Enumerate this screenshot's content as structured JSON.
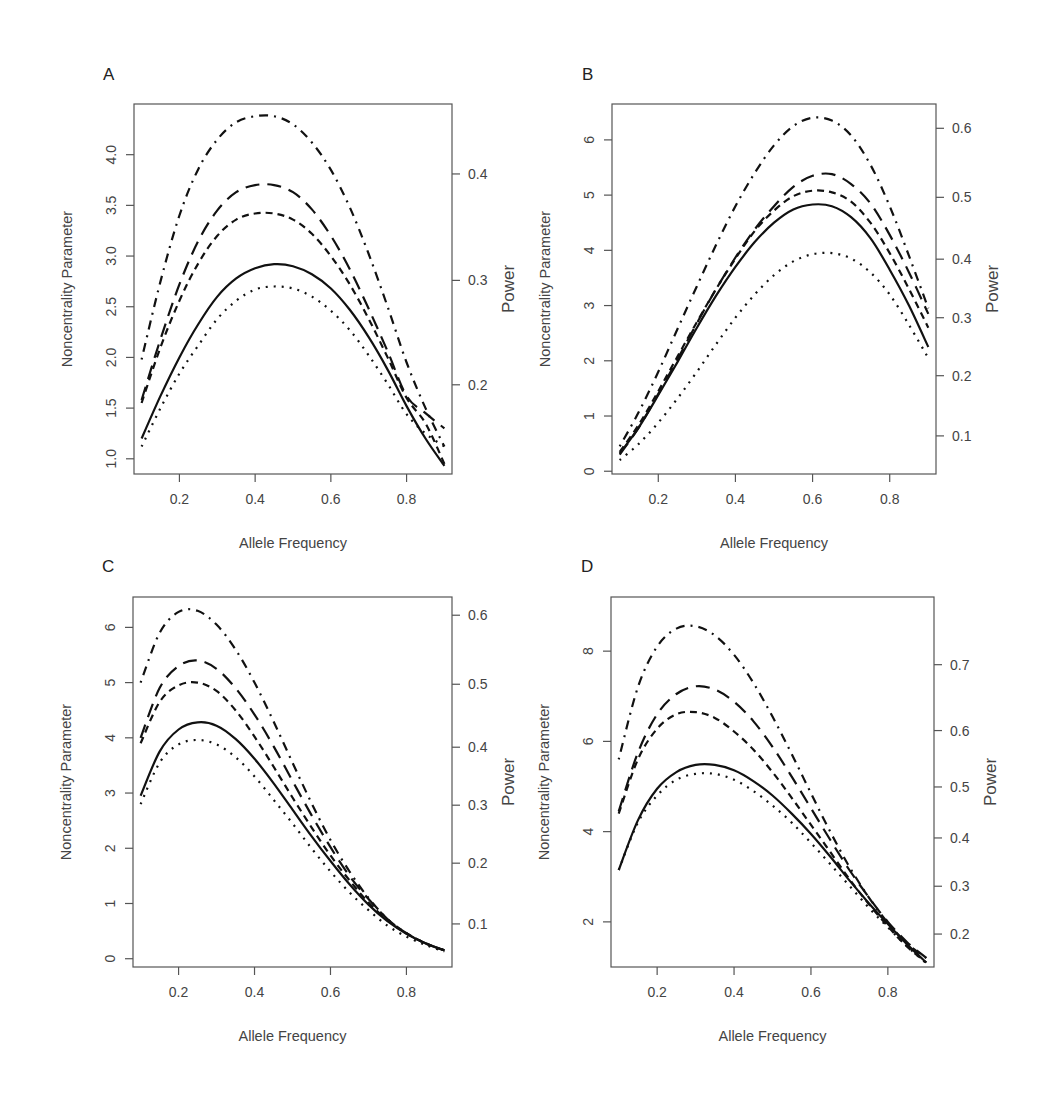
{
  "figure": {
    "background": "#ffffff",
    "line_color": "#111111"
  },
  "line_styles": {
    "solid": "",
    "dotted": "2 6",
    "dashed": "7 5",
    "longdash": "14 8",
    "dotdash": "2 6 9 6"
  },
  "chart_data": [
    {
      "panel": "A",
      "type": "line",
      "xlabel": "Allele Frequency",
      "ylabel": "Noncentrality Parameter",
      "ylabel_right": "Power",
      "xlim": [
        0.08,
        0.92
      ],
      "ylim": [
        0.85,
        4.5
      ],
      "x_ticks": [
        0.2,
        0.4,
        0.6,
        0.8
      ],
      "x_tick_labels": [
        "0.2",
        "0.4",
        "0.6",
        "0.8"
      ],
      "y_ticks": [
        1.0,
        1.5,
        2.0,
        2.5,
        3.0,
        3.5,
        4.0
      ],
      "y_tick_labels": [
        "1.0",
        "1.5",
        "2.0",
        "2.5",
        "3.0",
        "3.5",
        "4.0"
      ],
      "power_ticks": [
        {
          "label": "0.2",
          "ncp": 1.73
        },
        {
          "label": "0.3",
          "ncp": 2.76
        },
        {
          "label": "0.4",
          "ncp": 3.81
        }
      ],
      "grid": false,
      "legend": null,
      "box": {
        "left": 134,
        "top": 104,
        "right": 452,
        "bottom": 474
      },
      "label_pos": [
        103,
        80
      ],
      "x": [
        0.1,
        0.15,
        0.2,
        0.25,
        0.3,
        0.35,
        0.4,
        0.45,
        0.5,
        0.55,
        0.6,
        0.65,
        0.7,
        0.75,
        0.8,
        0.85,
        0.9
      ],
      "series": [
        {
          "name": "solid",
          "style": "solid",
          "values": [
            1.2,
            1.62,
            2.0,
            2.33,
            2.6,
            2.78,
            2.88,
            2.92,
            2.9,
            2.82,
            2.68,
            2.47,
            2.2,
            1.88,
            1.52,
            1.2,
            0.93
          ]
        },
        {
          "name": "dotted",
          "style": "dotted",
          "values": [
            1.12,
            1.5,
            1.84,
            2.12,
            2.38,
            2.56,
            2.67,
            2.7,
            2.68,
            2.6,
            2.46,
            2.27,
            2.02,
            1.74,
            1.44,
            1.25,
            1.12
          ]
        },
        {
          "name": "dashed",
          "style": "dashed",
          "values": [
            1.55,
            2.1,
            2.56,
            2.93,
            3.2,
            3.36,
            3.42,
            3.42,
            3.36,
            3.22,
            3.0,
            2.72,
            2.38,
            2.0,
            1.6,
            1.35,
            0.95
          ]
        },
        {
          "name": "longdash",
          "style": "longdash",
          "values": [
            1.58,
            2.18,
            2.72,
            3.15,
            3.45,
            3.63,
            3.7,
            3.7,
            3.63,
            3.46,
            3.2,
            2.87,
            2.48,
            2.06,
            1.62,
            1.45,
            1.3
          ]
        },
        {
          "name": "dotdash",
          "style": "dotdash",
          "values": [
            1.98,
            2.75,
            3.4,
            3.86,
            4.15,
            4.32,
            4.38,
            4.38,
            4.3,
            4.12,
            3.85,
            3.48,
            3.02,
            2.5,
            1.95,
            1.5,
            1.12
          ]
        }
      ]
    },
    {
      "panel": "B",
      "type": "line",
      "xlabel": "Allele Frequency",
      "ylabel": "Noncentrality Parameter",
      "ylabel_right": "Power",
      "xlim": [
        0.08,
        0.92
      ],
      "ylim": [
        -0.05,
        6.65
      ],
      "x_ticks": [
        0.2,
        0.4,
        0.6,
        0.8
      ],
      "x_tick_labels": [
        "0.2",
        "0.4",
        "0.6",
        "0.8"
      ],
      "y_ticks": [
        0,
        1,
        2,
        3,
        4,
        5,
        6
      ],
      "y_tick_labels": [
        "0",
        "1",
        "2",
        "3",
        "4",
        "5",
        "6"
      ],
      "power_ticks": [
        {
          "label": "0.1",
          "ncp": 0.64
        },
        {
          "label": "0.2",
          "ncp": 1.73
        },
        {
          "label": "0.3",
          "ncp": 2.78
        },
        {
          "label": "0.4",
          "ncp": 3.84
        },
        {
          "label": "0.5",
          "ncp": 4.96
        },
        {
          "label": "0.6",
          "ncp": 6.21
        }
      ],
      "grid": false,
      "legend": null,
      "box": {
        "left": 612,
        "top": 104,
        "right": 936,
        "bottom": 474
      },
      "label_pos": [
        582,
        80
      ],
      "x": [
        0.1,
        0.15,
        0.2,
        0.25,
        0.3,
        0.35,
        0.4,
        0.45,
        0.5,
        0.55,
        0.6,
        0.65,
        0.7,
        0.75,
        0.8,
        0.85,
        0.9
      ],
      "series": [
        {
          "name": "solid",
          "style": "solid",
          "values": [
            0.32,
            0.8,
            1.38,
            1.98,
            2.6,
            3.18,
            3.7,
            4.15,
            4.5,
            4.74,
            4.83,
            4.8,
            4.6,
            4.22,
            3.65,
            3.0,
            2.25
          ]
        },
        {
          "name": "dotted",
          "style": "dotted",
          "values": [
            0.2,
            0.5,
            0.88,
            1.32,
            1.8,
            2.3,
            2.78,
            3.2,
            3.55,
            3.8,
            3.93,
            3.95,
            3.85,
            3.6,
            3.2,
            2.65,
            2.05
          ]
        },
        {
          "name": "dashed",
          "style": "dashed",
          "values": [
            0.35,
            0.85,
            1.45,
            2.08,
            2.7,
            3.3,
            3.85,
            4.35,
            4.72,
            4.98,
            5.08,
            5.05,
            4.88,
            4.5,
            3.95,
            3.3,
            2.6
          ]
        },
        {
          "name": "longdash",
          "style": "longdash",
          "values": [
            0.3,
            0.8,
            1.4,
            2.03,
            2.68,
            3.3,
            3.87,
            4.38,
            4.8,
            5.15,
            5.35,
            5.38,
            5.2,
            4.85,
            4.28,
            3.6,
            2.85
          ]
        },
        {
          "name": "dotdash",
          "style": "dotdash",
          "values": [
            0.45,
            1.08,
            1.8,
            2.58,
            3.35,
            4.1,
            4.8,
            5.4,
            5.9,
            6.25,
            6.4,
            6.35,
            6.08,
            5.55,
            4.8,
            3.9,
            2.95
          ]
        }
      ]
    },
    {
      "panel": "C",
      "type": "line",
      "xlabel": "Allele Frequency",
      "ylabel": "Noncentrality Parameter",
      "ylabel_right": "Power",
      "xlim": [
        0.08,
        0.92
      ],
      "ylim": [
        -0.15,
        6.55
      ],
      "x_ticks": [
        0.2,
        0.4,
        0.6,
        0.8
      ],
      "x_tick_labels": [
        "0.2",
        "0.4",
        "0.6",
        "0.8"
      ],
      "y_ticks": [
        0,
        1,
        2,
        3,
        4,
        5,
        6
      ],
      "y_tick_labels": [
        "0",
        "1",
        "2",
        "3",
        "4",
        "5",
        "6"
      ],
      "power_ticks": [
        {
          "label": "0.1",
          "ncp": 0.63
        },
        {
          "label": "0.2",
          "ncp": 1.73
        },
        {
          "label": "0.3",
          "ncp": 2.78
        },
        {
          "label": "0.4",
          "ncp": 3.83
        },
        {
          "label": "0.5",
          "ncp": 4.97
        },
        {
          "label": "0.6",
          "ncp": 6.22
        }
      ],
      "grid": false,
      "legend": null,
      "box": {
        "left": 133,
        "top": 597,
        "right": 452,
        "bottom": 967
      },
      "label_pos": [
        102,
        572
      ],
      "x": [
        0.1,
        0.15,
        0.2,
        0.25,
        0.3,
        0.35,
        0.4,
        0.45,
        0.5,
        0.55,
        0.6,
        0.65,
        0.7,
        0.75,
        0.8,
        0.85,
        0.9
      ],
      "series": [
        {
          "name": "solid",
          "style": "solid",
          "values": [
            2.95,
            3.75,
            4.15,
            4.28,
            4.22,
            3.98,
            3.62,
            3.18,
            2.7,
            2.22,
            1.77,
            1.35,
            0.98,
            0.68,
            0.45,
            0.28,
            0.15
          ]
        },
        {
          "name": "dotted",
          "style": "dotted",
          "values": [
            2.8,
            3.55,
            3.88,
            3.96,
            3.88,
            3.65,
            3.3,
            2.88,
            2.45,
            2.0,
            1.58,
            1.2,
            0.88,
            0.6,
            0.4,
            0.25,
            0.13
          ]
        },
        {
          "name": "dashed",
          "style": "dashed",
          "values": [
            3.9,
            4.65,
            4.95,
            5.0,
            4.85,
            4.5,
            4.02,
            3.48,
            2.92,
            2.38,
            1.87,
            1.42,
            1.02,
            0.7,
            0.46,
            0.28,
            0.15
          ]
        },
        {
          "name": "longdash",
          "style": "longdash",
          "values": [
            4.0,
            4.9,
            5.3,
            5.4,
            5.25,
            4.9,
            4.42,
            3.85,
            3.22,
            2.6,
            2.02,
            1.5,
            1.08,
            0.72,
            0.46,
            0.28,
            0.15
          ]
        },
        {
          "name": "dotdash",
          "style": "dotdash",
          "values": [
            5.0,
            5.9,
            6.28,
            6.3,
            6.05,
            5.6,
            5.0,
            4.3,
            3.55,
            2.82,
            2.15,
            1.58,
            1.1,
            0.72,
            0.46,
            0.28,
            0.15
          ]
        }
      ]
    },
    {
      "panel": "D",
      "type": "line",
      "xlabel": "Allele Frequency",
      "ylabel": "Noncentrality Parameter",
      "ylabel_right": "Power",
      "xlim": [
        0.08,
        0.92
      ],
      "ylim": [
        1.0,
        9.2
      ],
      "x_ticks": [
        0.2,
        0.4,
        0.6,
        0.8
      ],
      "x_tick_labels": [
        "0.2",
        "0.4",
        "0.6",
        "0.8"
      ],
      "y_ticks": [
        2,
        4,
        6,
        8
      ],
      "y_tick_labels": [
        "2",
        "4",
        "6",
        "8"
      ],
      "power_ticks": [
        {
          "label": "0.2",
          "ncp": 1.73
        },
        {
          "label": "0.3",
          "ncp": 2.79
        },
        {
          "label": "0.4",
          "ncp": 3.86
        },
        {
          "label": "0.5",
          "ncp": 4.99
        },
        {
          "label": "0.6",
          "ncp": 6.24
        },
        {
          "label": "0.7",
          "ncp": 7.7
        }
      ],
      "grid": false,
      "legend": null,
      "box": {
        "left": 611,
        "top": 597,
        "right": 934,
        "bottom": 967
      },
      "label_pos": [
        581,
        572
      ],
      "x": [
        0.1,
        0.15,
        0.2,
        0.25,
        0.3,
        0.35,
        0.4,
        0.45,
        0.5,
        0.55,
        0.6,
        0.65,
        0.7,
        0.75,
        0.8,
        0.85,
        0.9
      ],
      "series": [
        {
          "name": "solid",
          "style": "solid",
          "values": [
            3.15,
            4.25,
            4.95,
            5.32,
            5.48,
            5.48,
            5.36,
            5.12,
            4.8,
            4.4,
            3.95,
            3.45,
            2.92,
            2.42,
            1.95,
            1.5,
            1.1
          ]
        },
        {
          "name": "dotted",
          "style": "dotted",
          "values": [
            3.15,
            4.2,
            4.8,
            5.15,
            5.28,
            5.28,
            5.15,
            4.9,
            4.58,
            4.2,
            3.75,
            3.28,
            2.8,
            2.32,
            1.88,
            1.46,
            1.08
          ]
        },
        {
          "name": "dashed",
          "style": "dashed",
          "values": [
            4.4,
            5.6,
            6.28,
            6.6,
            6.65,
            6.52,
            6.22,
            5.82,
            5.32,
            4.75,
            4.15,
            3.55,
            2.95,
            2.4,
            1.9,
            1.45,
            1.1
          ]
        },
        {
          "name": "longdash",
          "style": "longdash",
          "values": [
            4.45,
            5.75,
            6.6,
            7.05,
            7.22,
            7.15,
            6.88,
            6.45,
            5.88,
            5.22,
            4.52,
            3.82,
            3.15,
            2.55,
            2.0,
            1.55,
            1.2
          ]
        },
        {
          "name": "dotdash",
          "style": "dotdash",
          "values": [
            5.6,
            7.2,
            8.1,
            8.5,
            8.55,
            8.35,
            7.92,
            7.3,
            6.55,
            5.72,
            4.85,
            4.0,
            3.22,
            2.55,
            1.98,
            1.52,
            1.2
          ]
        }
      ]
    }
  ]
}
